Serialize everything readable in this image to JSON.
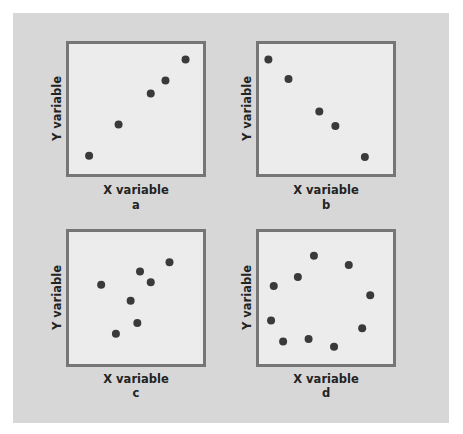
{
  "figure": {
    "panels": [
      {
        "id": "a",
        "xlabel": "X variable",
        "ylabel": "Y variable",
        "caption": "a"
      },
      {
        "id": "b",
        "xlabel": "X variable",
        "ylabel": "Y variable",
        "caption": "b"
      },
      {
        "id": "c",
        "xlabel": "X variable",
        "ylabel": "Y variable",
        "caption": "c"
      },
      {
        "id": "d",
        "xlabel": "X variable",
        "ylabel": "Y variable",
        "caption": "d"
      }
    ],
    "colors": {
      "background": "#d7d7d7",
      "plot_bg": "#ececec",
      "border": "#767676",
      "point": "#3a3a3a",
      "text": "#232323"
    }
  },
  "chart_data": [
    {
      "type": "scatter",
      "title": "a",
      "xlabel": "X variable",
      "ylabel": "Y variable",
      "description": "positive linear relationship",
      "points": [
        [
          15,
          14
        ],
        [
          37,
          38
        ],
        [
          61,
          62
        ],
        [
          72,
          72
        ],
        [
          87,
          88
        ]
      ],
      "xlim": [
        0,
        100
      ],
      "ylim": [
        0,
        100
      ],
      "grid": false
    },
    {
      "type": "scatter",
      "title": "b",
      "xlabel": "X variable",
      "ylabel": "Y variable",
      "description": "negative linear relationship",
      "points": [
        [
          7,
          88
        ],
        [
          22,
          73
        ],
        [
          45,
          48
        ],
        [
          57,
          37
        ],
        [
          79,
          13
        ]
      ],
      "xlim": [
        0,
        100
      ],
      "ylim": [
        0,
        100
      ],
      "grid": false
    },
    {
      "type": "scatter",
      "title": "c",
      "xlabel": "X variable",
      "ylabel": "Y variable",
      "description": "weak positive relationship",
      "points": [
        [
          24,
          60
        ],
        [
          53,
          70
        ],
        [
          61,
          62
        ],
        [
          75,
          77
        ],
        [
          46,
          48
        ],
        [
          51,
          31
        ],
        [
          35,
          23
        ]
      ],
      "xlim": [
        0,
        100
      ],
      "ylim": [
        0,
        100
      ],
      "grid": false
    },
    {
      "type": "scatter",
      "title": "d",
      "xlabel": "X variable",
      "ylabel": "Y variable",
      "description": "no linear relationship (circular pattern)",
      "points": [
        [
          41,
          82
        ],
        [
          67,
          75
        ],
        [
          29,
          66
        ],
        [
          11,
          59
        ],
        [
          83,
          52
        ],
        [
          9,
          33
        ],
        [
          77,
          27
        ],
        [
          18,
          17
        ],
        [
          37,
          19
        ],
        [
          56,
          13
        ]
      ],
      "xlim": [
        0,
        100
      ],
      "ylim": [
        0,
        100
      ],
      "grid": false
    }
  ]
}
